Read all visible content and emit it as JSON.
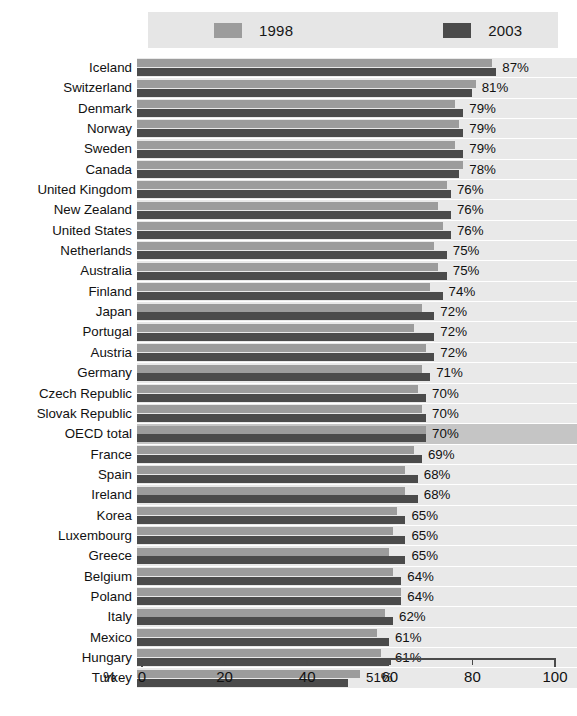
{
  "legend": {
    "entries": [
      {
        "label": "1998",
        "color": "#9c9c9c"
      },
      {
        "label": "2003",
        "color": "#4b4b4b"
      }
    ]
  },
  "axis": {
    "unit_label": "%",
    "ticks": [
      "0",
      "20",
      "40",
      "60",
      "80",
      "100"
    ]
  },
  "chart_data": {
    "type": "bar",
    "orientation": "horizontal",
    "title": "",
    "subtitle": "",
    "xlabel": "%",
    "ylabel": "",
    "xlim": [
      0,
      100
    ],
    "xticks": [
      0,
      20,
      40,
      60,
      80,
      100
    ],
    "grid": false,
    "legend_position": "top",
    "highlighted_category": "OECD total",
    "data_labels_series": "2003",
    "categories": [
      "Iceland",
      "Switzerland",
      "Denmark",
      "Norway",
      "Sweden",
      "Canada",
      "United Kingdom",
      "New Zealand",
      "United States",
      "Netherlands",
      "Australia",
      "Finland",
      "Japan",
      "Portugal",
      "Austria",
      "Germany",
      "Czech Republic",
      "Slovak Republic",
      "OECD total",
      "France",
      "Spain",
      "Ireland",
      "Korea",
      "Luxembourg",
      "Greece",
      "Belgium",
      "Poland",
      "Italy",
      "Mexico",
      "Hungary",
      "Turkey"
    ],
    "series": [
      {
        "name": "1998",
        "color": "#9c9c9c",
        "values": [
          86,
          82,
          77,
          78,
          77,
          79,
          75,
          73,
          74,
          72,
          73,
          71,
          69,
          67,
          70,
          69,
          68,
          69,
          70,
          67,
          65,
          65,
          63,
          62,
          61,
          62,
          64,
          60,
          58,
          59,
          54
        ]
      },
      {
        "name": "2003",
        "color": "#4b4b4b",
        "values": [
          87,
          81,
          79,
          79,
          79,
          78,
          76,
          76,
          76,
          75,
          75,
          74,
          72,
          72,
          72,
          71,
          70,
          70,
          70,
          69,
          68,
          68,
          65,
          65,
          65,
          64,
          64,
          62,
          61,
          61,
          51
        ]
      }
    ],
    "value_labels": [
      "87%",
      "81%",
      "79%",
      "79%",
      "79%",
      "78%",
      "76%",
      "76%",
      "76%",
      "75%",
      "75%",
      "74%",
      "72%",
      "72%",
      "72%",
      "71%",
      "70%",
      "70%",
      "70%",
      "69%",
      "68%",
      "68%",
      "65%",
      "65%",
      "65%",
      "64%",
      "64%",
      "62%",
      "61%",
      "61%",
      "51%"
    ]
  }
}
